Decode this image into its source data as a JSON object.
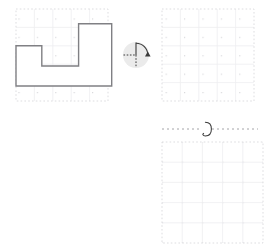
{
  "page": {
    "title": "Shape Rotation Worksheet",
    "background_color": "#ffffff",
    "width": 272,
    "height": 248
  },
  "style": {
    "grid_dot_color": "#d9d9dc",
    "grid_line_color": "#eeeef0",
    "shape_stroke_color": "#808084",
    "shape_fill_color": "#ffffff",
    "shape_stroke_width": 1.4,
    "icon_disc_color": "#ebebeb",
    "icon_stroke_color": "#3a3a3a",
    "axis_dash_color": "#9a9a9e",
    "loop_color": "#3a3a3a"
  },
  "panels": {
    "source": {
      "label": "source-shape-panel",
      "grid": {
        "x": 16,
        "y": 9,
        "cols": 5,
        "rows": 5,
        "cell": 18.4
      },
      "shape": {
        "name": "step-polygon",
        "description": "L-shaped step figure with a notch",
        "points_grid": [
          [
            0,
            2
          ],
          [
            1.4,
            2
          ],
          [
            1.4,
            3.1
          ],
          [
            3.4,
            3.1
          ],
          [
            3.4,
            0.8
          ],
          [
            5.2,
            0.8
          ],
          [
            5.2,
            4.2
          ],
          [
            0,
            4.2
          ]
        ]
      }
    },
    "answer_top": {
      "label": "answer-grid-top",
      "grid": {
        "x": 162,
        "y": 9,
        "cols": 5,
        "rows": 5,
        "cell": 18.4
      },
      "contents": ""
    },
    "answer_bottom": {
      "label": "answer-grid-bottom",
      "grid": {
        "x": 162,
        "y": 142,
        "cols": 5,
        "rows": 5,
        "cell": 20.2
      },
      "contents": ""
    }
  },
  "rotation_icon": {
    "name": "quarter-turn-rotation-icon",
    "cx": 136,
    "cy": 55,
    "radius": 13,
    "arc_degrees": 90,
    "arrow": "clockwise",
    "axes": {
      "vertical": "solid",
      "horizontal_left": "dashed",
      "vertical_down": "dashed"
    }
  },
  "mirror_axis": {
    "name": "horizontal-rotation-axis",
    "x1": 162,
    "x2": 258,
    "y": 129,
    "dash": "2 3",
    "loop": {
      "name": "rotation-loop-glyph",
      "cx": 207,
      "cy": 129,
      "rx": 4.2,
      "ry": 7.5
    }
  },
  "a11y": {
    "source_alt": "Step-shaped polygon drawn on a dotted grid",
    "icon_alt": "Quarter turn clockwise rotation symbol",
    "axis_alt": "Dashed horizontal axis with rotation loop",
    "answer_top_alt": "Empty answer grid, top",
    "answer_bottom_alt": "Empty answer grid, bottom"
  }
}
